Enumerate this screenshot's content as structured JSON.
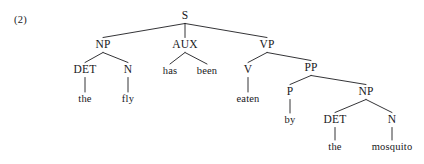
{
  "figure": {
    "example_number": "(2)",
    "example_number_x": 14,
    "example_number_y": 14,
    "background_color": "#ffffff",
    "line_color": "#1d1d20",
    "text_color": "#17171b",
    "sentence": "the fly has been eaten by the mosquito"
  },
  "tree": {
    "type": "constituency-syntax-tree",
    "nodes": [
      {
        "id": "S",
        "label": "S",
        "kind": "category",
        "x": 185,
        "y": 16
      },
      {
        "id": "NP1",
        "label": "NP",
        "kind": "category",
        "x": 103,
        "y": 45
      },
      {
        "id": "AUX",
        "label": "AUX",
        "kind": "category",
        "x": 185,
        "y": 45
      },
      {
        "id": "VP",
        "label": "VP",
        "kind": "category",
        "x": 267,
        "y": 45
      },
      {
        "id": "DET1",
        "label": "DET",
        "kind": "category",
        "x": 85,
        "y": 70
      },
      {
        "id": "N1",
        "label": "N",
        "kind": "category",
        "x": 128,
        "y": 70
      },
      {
        "id": "has",
        "label": "has",
        "kind": "word",
        "x": 170,
        "y": 71
      },
      {
        "id": "been",
        "label": "been",
        "kind": "word",
        "x": 207,
        "y": 71
      },
      {
        "id": "V",
        "label": "V",
        "kind": "category",
        "x": 248,
        "y": 70
      },
      {
        "id": "PP",
        "label": "PP",
        "kind": "category",
        "x": 311,
        "y": 68
      },
      {
        "id": "the1",
        "label": "the",
        "kind": "word",
        "x": 85,
        "y": 99
      },
      {
        "id": "fly",
        "label": "fly",
        "kind": "word",
        "x": 128,
        "y": 99
      },
      {
        "id": "eaten",
        "label": "eaten",
        "kind": "word",
        "x": 248,
        "y": 99
      },
      {
        "id": "P",
        "label": "P",
        "kind": "category",
        "x": 290,
        "y": 92
      },
      {
        "id": "NP2",
        "label": "NP",
        "kind": "category",
        "x": 366,
        "y": 92
      },
      {
        "id": "by",
        "label": "by",
        "kind": "word",
        "x": 290,
        "y": 120
      },
      {
        "id": "DET2",
        "label": "DET",
        "kind": "category",
        "x": 335,
        "y": 120
      },
      {
        "id": "N2",
        "label": "N",
        "kind": "category",
        "x": 392,
        "y": 120
      },
      {
        "id": "the2",
        "label": "the",
        "kind": "word",
        "x": 335,
        "y": 147
      },
      {
        "id": "mosquito",
        "label": "mosquito",
        "kind": "word",
        "x": 392,
        "y": 147
      }
    ],
    "edges": [
      {
        "from": "S",
        "to": "NP1"
      },
      {
        "from": "S",
        "to": "AUX"
      },
      {
        "from": "S",
        "to": "VP"
      },
      {
        "from": "NP1",
        "to": "DET1"
      },
      {
        "from": "NP1",
        "to": "N1"
      },
      {
        "from": "AUX",
        "to": "has"
      },
      {
        "from": "AUX",
        "to": "been"
      },
      {
        "from": "VP",
        "to": "V"
      },
      {
        "from": "VP",
        "to": "PP"
      },
      {
        "from": "DET1",
        "to": "the1"
      },
      {
        "from": "N1",
        "to": "fly"
      },
      {
        "from": "V",
        "to": "eaten"
      },
      {
        "from": "PP",
        "to": "P"
      },
      {
        "from": "PP",
        "to": "NP2"
      },
      {
        "from": "P",
        "to": "by"
      },
      {
        "from": "NP2",
        "to": "DET2"
      },
      {
        "from": "NP2",
        "to": "N2"
      },
      {
        "from": "DET2",
        "to": "the2"
      },
      {
        "from": "N2",
        "to": "mosquito"
      }
    ]
  }
}
